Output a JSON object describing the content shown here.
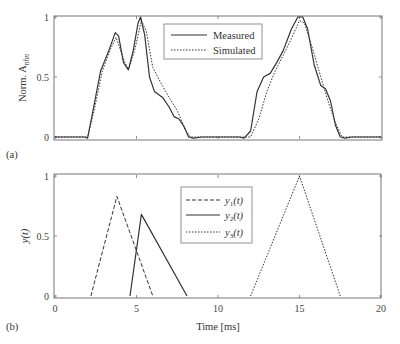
{
  "chart_data": [
    {
      "panel": "(a)",
      "type": "line",
      "title": "",
      "xlabel": "",
      "ylabel": "Norm. A_nhn",
      "ylabel_main": "Norm. A",
      "ylabel_sub": "nhn",
      "xlim": [
        0,
        20
      ],
      "ylim": [
        0,
        1
      ],
      "yticks": [
        "0",
        "0.5",
        "1"
      ],
      "legend_position": "upper center",
      "grid": false,
      "series": [
        {
          "name": "Measured",
          "style": "solid",
          "x": [
            0,
            1.8,
            2.0,
            2.3,
            2.8,
            3.3,
            3.7,
            3.9,
            4.2,
            4.5,
            4.8,
            5.1,
            5.25,
            5.5,
            5.8,
            6.1,
            6.6,
            7.0,
            7.3,
            7.6,
            7.9,
            8.2,
            8.5,
            9.0,
            11.3,
            11.6,
            12.0,
            12.4,
            12.8,
            13.2,
            13.6,
            14.0,
            14.5,
            14.9,
            15.2,
            15.5,
            15.9,
            16.3,
            16.6,
            16.9,
            17.2,
            17.5,
            17.8,
            18.2,
            20
          ],
          "y": [
            0.0,
            0.0,
            -0.01,
            0.2,
            0.55,
            0.72,
            0.87,
            0.84,
            0.62,
            0.56,
            0.72,
            0.95,
            1.0,
            0.85,
            0.5,
            0.38,
            0.33,
            0.25,
            0.17,
            0.15,
            0.09,
            0.0,
            -0.01,
            0.0,
            0.0,
            -0.01,
            0.05,
            0.38,
            0.5,
            0.53,
            0.62,
            0.72,
            0.9,
            1.0,
            1.0,
            0.9,
            0.6,
            0.43,
            0.4,
            0.3,
            0.1,
            0.0,
            -0.01,
            0.0,
            0.0
          ]
        },
        {
          "name": "Simulated",
          "style": "dotted",
          "x": [
            0,
            2.0,
            2.4,
            2.9,
            3.4,
            3.75,
            4.2,
            4.5,
            4.9,
            5.3,
            5.6,
            6.0,
            6.5,
            7.0,
            7.5,
            8.0,
            8.3,
            12.0,
            12.5,
            13.0,
            13.5,
            14.0,
            14.5,
            15.0,
            15.3,
            15.7,
            16.2,
            16.7,
            17.2,
            17.6,
            20
          ],
          "y": [
            0.0,
            0.0,
            0.22,
            0.55,
            0.73,
            0.83,
            0.65,
            0.56,
            0.73,
            0.97,
            0.88,
            0.58,
            0.45,
            0.33,
            0.22,
            0.06,
            0.0,
            0.0,
            0.15,
            0.38,
            0.55,
            0.68,
            0.82,
            0.97,
            0.95,
            0.78,
            0.55,
            0.32,
            0.12,
            0.0,
            0.0
          ]
        }
      ]
    },
    {
      "panel": "(b)",
      "type": "line",
      "title": "",
      "xlabel": "Time [ms]",
      "ylabel": "y(t)",
      "xlim": [
        0,
        20
      ],
      "ylim": [
        0,
        1
      ],
      "xticks": [
        "0",
        "5",
        "10",
        "15",
        "20"
      ],
      "yticks": [
        "0",
        "0.5",
        "1"
      ],
      "legend_position": "upper center",
      "grid": false,
      "series": [
        {
          "name": "y1(t)",
          "label_main": "y",
          "label_sub": "1",
          "label_arg": "(t)",
          "style": "dashed",
          "x": [
            2.2,
            3.8,
            6.0
          ],
          "y": [
            0,
            0.83,
            0
          ]
        },
        {
          "name": "y2(t)",
          "label_main": "y",
          "label_sub": "2",
          "label_arg": "(t)",
          "style": "solid",
          "x": [
            4.6,
            5.3,
            8.1
          ],
          "y": [
            0,
            0.68,
            0
          ]
        },
        {
          "name": "y3(t)",
          "label_main": "y",
          "label_sub": "3",
          "label_arg": "(t)",
          "style": "dotted",
          "x": [
            12.0,
            15.0,
            17.5
          ],
          "y": [
            0,
            1.0,
            0
          ]
        }
      ]
    }
  ],
  "panel_labels": {
    "a": "(a)",
    "b": "(b)"
  },
  "colors": {
    "line": "#333333",
    "axis": "#666666",
    "legend_border": "#777777"
  }
}
